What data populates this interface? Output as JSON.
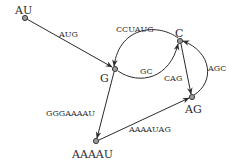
{
  "diagram": {
    "type": "directed-graph",
    "colors": {
      "line": "#2b2b2b",
      "node_fill": "#9a9a9a",
      "background": "#ffffff"
    },
    "nodes": [
      {
        "id": "AU",
        "label": "AU"
      },
      {
        "id": "G",
        "label": "G"
      },
      {
        "id": "C",
        "label": "C"
      },
      {
        "id": "AG",
        "label": "AG"
      },
      {
        "id": "AAAAU",
        "label": "AAAAU"
      }
    ],
    "edges": [
      {
        "from": "AU",
        "to": "G",
        "label": "AUG"
      },
      {
        "from": "C",
        "to": "G",
        "label": "CCUAUG"
      },
      {
        "from": "G",
        "to": "C",
        "label": "GC"
      },
      {
        "from": "C",
        "to": "AG",
        "label": "CAG"
      },
      {
        "from": "AG",
        "to": "C",
        "label": "AGC"
      },
      {
        "from": "G",
        "to": "AAAAU",
        "label": "GGGAAAAU"
      },
      {
        "from": "AAAAU",
        "to": "AG",
        "label": "AAAAUAG"
      }
    ]
  }
}
